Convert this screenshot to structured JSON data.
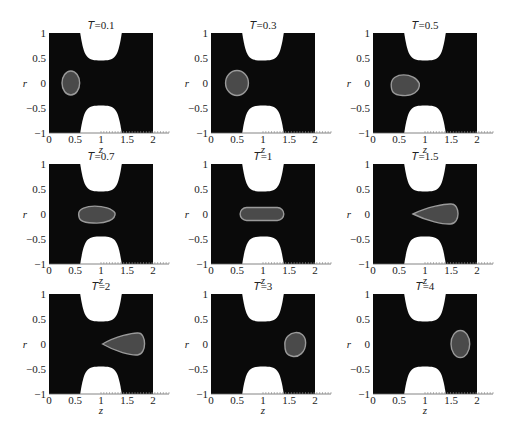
{
  "chart_data": {
    "type": "heatmap",
    "xlabel": "z",
    "ylabel": "r",
    "xlim": [
      0,
      2
    ],
    "ylim": [
      -1,
      1
    ],
    "xticks": [
      "0",
      "0.5",
      "1",
      "1.5",
      "2"
    ],
    "yticks": [
      "1",
      "0.5",
      "0",
      "−0.5",
      "−1"
    ],
    "grid": false,
    "colors": {
      "background": "#0a0a0a",
      "obstacle": "#ffffff",
      "droplet_fill": "#4a4a4a",
      "droplet_outline": "#9a9a9a"
    },
    "obstacle": {
      "center_z": 1.0,
      "half_width_at_edge": 0.4,
      "tip_r": 0.45
    },
    "panels": [
      {
        "title": "T=0.1",
        "T": 0.1,
        "droplet": {
          "shape": "ellipse",
          "center_z": 0.42,
          "center_r": 0.0,
          "half_len_z": 0.17,
          "half_len_r": 0.24
        }
      },
      {
        "title": "T=0.3",
        "T": 0.3,
        "droplet": {
          "shape": "ellipse",
          "center_z": 0.5,
          "center_r": 0.0,
          "half_len_z": 0.22,
          "half_len_r": 0.25
        }
      },
      {
        "title": "T=0.5",
        "T": 0.5,
        "droplet": {
          "shape": "egg",
          "center_z": 0.62,
          "center_r": -0.03,
          "half_len_z": 0.27,
          "half_len_r": 0.22
        }
      },
      {
        "title": "T=0.7",
        "T": 0.7,
        "droplet": {
          "shape": "egg",
          "center_z": 0.92,
          "center_r": 0.0,
          "half_len_z": 0.35,
          "half_len_r": 0.18
        }
      },
      {
        "title": "T=1",
        "T": 1,
        "droplet": {
          "shape": "capsule",
          "center_z": 0.98,
          "center_r": 0.0,
          "half_len_z": 0.42,
          "half_len_r": 0.13
        }
      },
      {
        "title": "T=1.5",
        "T": 1.5,
        "droplet": {
          "shape": "teardrop-right",
          "center_z": 1.22,
          "center_r": 0.0,
          "half_len_z": 0.45,
          "half_len_r": 0.2
        }
      },
      {
        "title": "T=2",
        "T": 2,
        "droplet": {
          "shape": "teardrop-right",
          "center_z": 1.45,
          "center_r": 0.0,
          "half_len_z": 0.42,
          "half_len_r": 0.22
        }
      },
      {
        "title": "T=3",
        "T": 3,
        "droplet": {
          "shape": "egg-right",
          "center_z": 1.62,
          "center_r": 0.0,
          "half_len_z": 0.2,
          "half_len_r": 0.25
        }
      },
      {
        "title": "T=4",
        "T": 4,
        "droplet": {
          "shape": "ellipse",
          "center_z": 1.68,
          "center_r": 0.0,
          "half_len_z": 0.18,
          "half_len_r": 0.27
        }
      }
    ]
  },
  "layout": {
    "cols_left": [
      49,
      211,
      373
    ],
    "rows_top": [
      33,
      164,
      294
    ],
    "plot_w": 104,
    "plot_h": 100
  }
}
